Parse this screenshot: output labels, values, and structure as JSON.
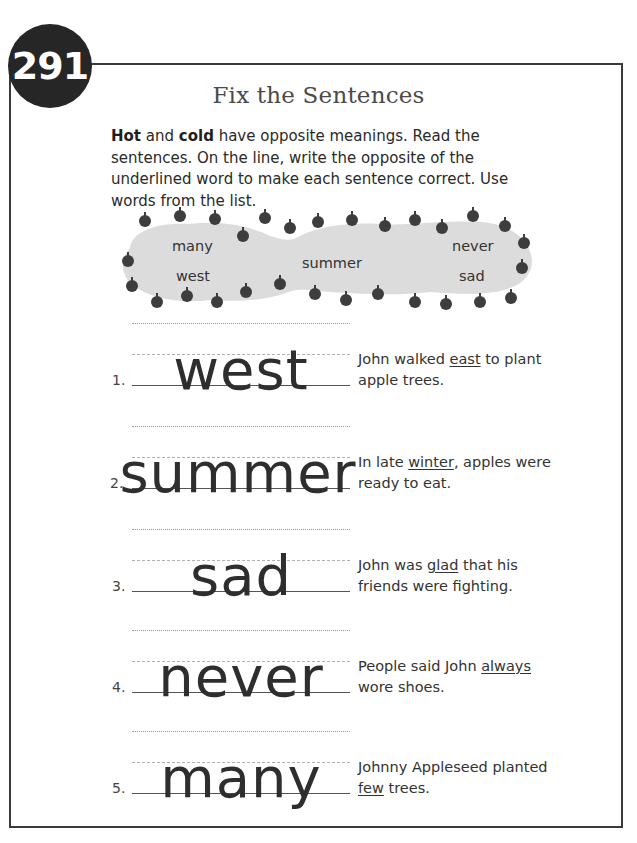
{
  "page": {
    "number": "291",
    "title": "Fix the Sentences"
  },
  "instructions": {
    "bold1": "Hot",
    "text1": " and ",
    "bold2": "cold",
    "text2": " have opposite meanings. Read the sentences. On the line, write the opposite of the underlined word to make each sentence correct. Use words from the list."
  },
  "word_bank": {
    "words": [
      "many",
      "west",
      "summer",
      "never",
      "sad"
    ],
    "decoration": "apple-icon border",
    "cloud_color": "#dcdcdc",
    "apple_color": "#3d3d3d"
  },
  "items": [
    {
      "number": "1.",
      "answer": "west",
      "before": "John walked ",
      "underlined": "east",
      "after": " to plant apple trees."
    },
    {
      "number": "2.",
      "answer": "summer",
      "before": "In late ",
      "underlined": "winter",
      "after": ", apples were ready to eat."
    },
    {
      "number": "3.",
      "answer": "sad",
      "before": "John was ",
      "underlined": "glad",
      "after": " that his friends were fighting."
    },
    {
      "number": "4.",
      "answer": "never",
      "before": "People said John ",
      "underlined": "always",
      "after": " wore shoes."
    },
    {
      "number": "5.",
      "answer": "many",
      "before": "Johnny Appleseed planted ",
      "underlined": "few",
      "after": " trees."
    }
  ]
}
